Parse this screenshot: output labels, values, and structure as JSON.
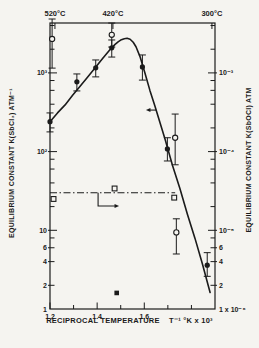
{
  "figure": {
    "background": "#f5f4f0",
    "ink": "#1b1b1b"
  },
  "chart_data": {
    "type": "scatter-line",
    "title": "",
    "x_axis": {
      "label": "RECIPROCAL TEMPERATURE    T⁻¹ °K x 10³",
      "range": [
        1.2,
        1.9
      ],
      "tick_labels": [
        {
          "text": "1.2",
          "t": 1.2
        },
        {
          "text": "1.4",
          "t": 1.4
        },
        {
          "text": "1.6",
          "t": 1.6
        }
      ],
      "minor_ticks": [
        1.3,
        1.5,
        1.7,
        1.8
      ]
    },
    "top_axis": {
      "ticks": [
        {
          "text": "520°C",
          "t": 1.221
        },
        {
          "text": "420°C",
          "t": 1.467
        },
        {
          "text": "300°C",
          "t": 1.887
        }
      ]
    },
    "left_axis": {
      "title": "EQUILIBRIUM CONSTANT  K(SbCl₃)  ATM⁻¹",
      "scale": "log",
      "range": [
        1,
        4300
      ],
      "tick_labels": [
        {
          "text": "10³",
          "v": 1000
        },
        {
          "text": "10²",
          "v": 100
        },
        {
          "text": "10",
          "v": 10
        },
        {
          "text": "6",
          "v": 6
        },
        {
          "text": "4",
          "v": 4
        },
        {
          "text": "2",
          "v": 2
        },
        {
          "text": "1",
          "v": 1
        }
      ],
      "minor_ticks": [
        8,
        20,
        40,
        60,
        80,
        200,
        400,
        600,
        800,
        2000,
        4000
      ]
    },
    "right_axis": {
      "title": "EQUILIBRIUM CONSTANT  K(SbOCl)  ATM",
      "scale": "log",
      "unit_factor": 1e-06,
      "range": [
        1e-06,
        0.0043
      ],
      "tick_labels": [
        {
          "text": "10⁻³",
          "v": 0.001
        },
        {
          "text": "10⁻⁴",
          "v": 0.0001
        },
        {
          "text": "10⁻⁵",
          "v": 1e-05
        },
        {
          "text": "6",
          "v": 6e-06
        },
        {
          "text": "4",
          "v": 4e-06
        },
        {
          "text": "2",
          "v": 2e-06
        },
        {
          "text": "1 x 10⁻⁶",
          "v": 1e-06
        }
      ],
      "minor_ticks": [
        8e-06,
        2e-05,
        4e-05,
        6e-05,
        8e-05,
        0.0002,
        0.0004,
        0.0006,
        0.0008,
        0.002,
        0.004
      ]
    },
    "series": [
      {
        "name": "K(SbCl3) measured (filled circles)",
        "marker": "filled-circle",
        "axis": "left",
        "points": [
          {
            "t": 1.2,
            "k": 240,
            "err": [
              178,
              310
            ]
          },
          {
            "t": 1.314,
            "k": 770,
            "err": [
              590,
              970
            ]
          },
          {
            "t": 1.394,
            "k": 1160,
            "err": [
              890,
              1460
            ]
          },
          {
            "t": 1.462,
            "k": 2080,
            "err": [
              1590,
              2620
            ]
          },
          {
            "t": 1.592,
            "k": 1190,
            "err": [
              810,
              1690
            ]
          },
          {
            "t": 1.698,
            "k": 108,
            "err": [
              76,
              150
            ]
          },
          {
            "t": 1.867,
            "k": 3.6,
            "err": [
              2.6,
              5.2
            ]
          }
        ]
      },
      {
        "name": "open-circle measurements",
        "marker": "open-circle",
        "axis": "left",
        "points": [
          {
            "t": 1.209,
            "k": 2700,
            "err": [
              1150,
              4840
            ]
          },
          {
            "t": 1.462,
            "k": 3050,
            "err": [
              2130,
              4300
            ]
          },
          {
            "t": 1.731,
            "k": 150,
            "err": [
              68,
              300
            ]
          },
          {
            "t": 1.736,
            "k": 9.4,
            "err": [
              5,
              14
            ]
          }
        ]
      },
      {
        "name": "K(SbOCl) (open squares, dash-dot line)",
        "marker": "open-square",
        "axis": "right",
        "points": [
          {
            "t": 1.215,
            "k": 2.5e-05
          },
          {
            "t": 1.474,
            "k": 3.4e-05
          },
          {
            "t": 1.727,
            "k": 2.6e-05
          }
        ],
        "line": {
          "style": "dash-dot",
          "k": 3e-05,
          "t_from": 1.2,
          "t_to": 1.731
        }
      },
      {
        "name": "filled-square point",
        "marker": "filled-square",
        "axis": "left",
        "points": [
          {
            "t": 1.483,
            "k": 1.6
          }
        ]
      }
    ],
    "fit_curve": {
      "axis": "left",
      "points": [
        [
          1.2,
          239
        ],
        [
          1.232,
          310
        ],
        [
          1.264,
          392
        ],
        [
          1.296,
          520
        ],
        [
          1.327,
          673
        ],
        [
          1.359,
          880
        ],
        [
          1.391,
          1153
        ],
        [
          1.423,
          1520
        ],
        [
          1.455,
          1975
        ],
        [
          1.476,
          2300
        ],
        [
          1.489,
          2480
        ],
        [
          1.503,
          2640
        ],
        [
          1.515,
          2720
        ],
        [
          1.527,
          2750
        ],
        [
          1.54,
          2680
        ],
        [
          1.553,
          2450
        ],
        [
          1.565,
          2150
        ],
        [
          1.582,
          1610
        ],
        [
          1.603,
          990
        ],
        [
          1.624,
          600
        ],
        [
          1.645,
          380
        ],
        [
          1.667,
          230
        ],
        [
          1.688,
          144
        ],
        [
          1.72,
          66
        ],
        [
          1.751,
          34
        ],
        [
          1.783,
          16
        ],
        [
          1.815,
          7.9
        ],
        [
          1.847,
          3.7
        ],
        [
          1.879,
          1.62
        ]
      ]
    },
    "annotations": {
      "left_arrow": {
        "k": 337,
        "t_from": 1.65,
        "t_to": 1.607
      },
      "right_arrow": {
        "t_drop": 1.404,
        "k_from": 3e-05,
        "k_to": 2.04e-05,
        "t_to": 1.476
      }
    }
  }
}
